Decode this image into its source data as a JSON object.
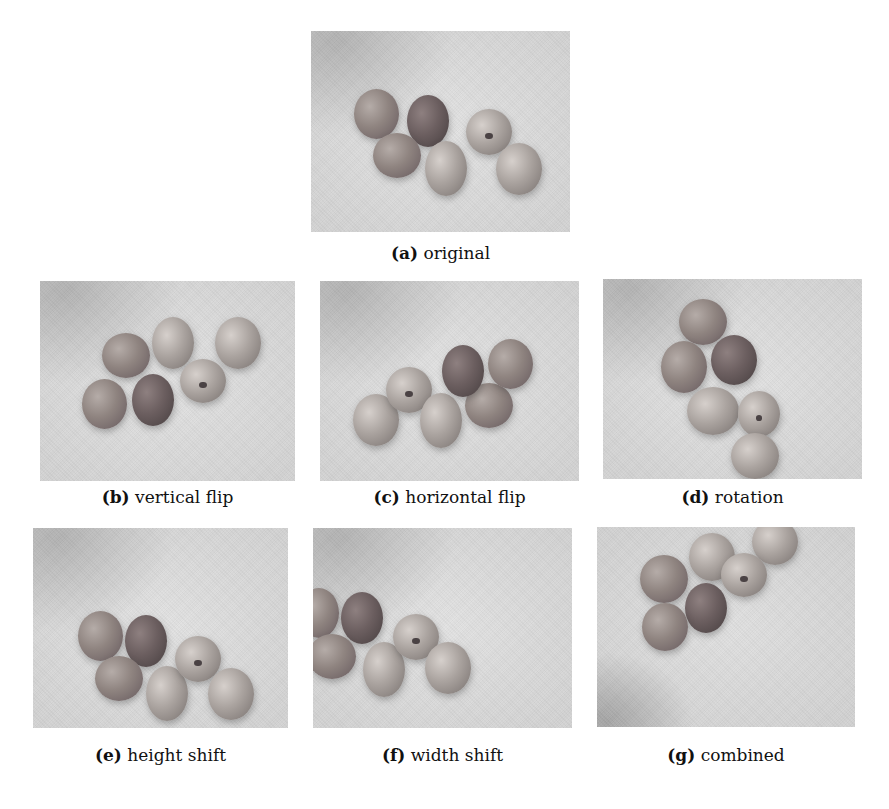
{
  "figure": {
    "panels": [
      {
        "id": "a",
        "label": "(a)",
        "caption": "original"
      },
      {
        "id": "b",
        "label": "(b)",
        "caption": "vertical flip"
      },
      {
        "id": "c",
        "label": "(c)",
        "caption": "horizontal flip"
      },
      {
        "id": "d",
        "label": "(d)",
        "caption": "rotation"
      },
      {
        "id": "e",
        "label": "(e)",
        "caption": "height shift"
      },
      {
        "id": "f",
        "label": "(f)",
        "caption": "width shift"
      },
      {
        "id": "g",
        "label": "(g)",
        "caption": "combined"
      }
    ],
    "image_subject": "grayscale photo of seven seeds on a light background"
  }
}
